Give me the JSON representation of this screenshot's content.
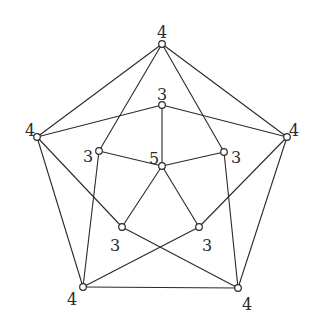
{
  "diagram": {
    "type": "graph",
    "nodes": [
      {
        "id": "A",
        "x": 162,
        "y": 44,
        "label": "4",
        "lx": 162,
        "ly": 33,
        "anchor": "middle"
      },
      {
        "id": "B",
        "x": 37,
        "y": 137,
        "label": "4",
        "lx": 30,
        "ly": 131,
        "anchor": "middle"
      },
      {
        "id": "C",
        "x": 287,
        "y": 137,
        "label": "4",
        "lx": 294,
        "ly": 131,
        "anchor": "middle"
      },
      {
        "id": "D",
        "x": 83,
        "y": 287,
        "label": "4",
        "lx": 72,
        "ly": 300,
        "anchor": "middle"
      },
      {
        "id": "E",
        "x": 238,
        "y": 288,
        "label": "4",
        "lx": 247,
        "ly": 305,
        "anchor": "middle"
      },
      {
        "id": "F",
        "x": 162,
        "y": 105,
        "label": "3",
        "lx": 162,
        "ly": 95,
        "anchor": "middle"
      },
      {
        "id": "G",
        "x": 99,
        "y": 151,
        "label": "3",
        "lx": 88,
        "ly": 157,
        "anchor": "middle"
      },
      {
        "id": "H",
        "x": 224,
        "y": 152,
        "label": "3",
        "lx": 236,
        "ly": 158,
        "anchor": "middle"
      },
      {
        "id": "K",
        "x": 162,
        "y": 166,
        "label": "5",
        "lx": 154,
        "ly": 159,
        "anchor": "middle"
      },
      {
        "id": "I",
        "x": 122,
        "y": 227,
        "label": "3",
        "lx": 115,
        "ly": 246,
        "anchor": "middle"
      },
      {
        "id": "J",
        "x": 199,
        "y": 227,
        "label": "3",
        "lx": 207,
        "ly": 246,
        "anchor": "middle"
      }
    ],
    "edges": [
      [
        "A",
        "B"
      ],
      [
        "A",
        "C"
      ],
      [
        "B",
        "D"
      ],
      [
        "C",
        "E"
      ],
      [
        "D",
        "E"
      ],
      [
        "A",
        "G"
      ],
      [
        "A",
        "H"
      ],
      [
        "B",
        "F"
      ],
      [
        "C",
        "F"
      ],
      [
        "B",
        "I"
      ],
      [
        "C",
        "J"
      ],
      [
        "G",
        "D"
      ],
      [
        "H",
        "E"
      ],
      [
        "I",
        "E"
      ],
      [
        "J",
        "D"
      ],
      [
        "F",
        "K"
      ],
      [
        "G",
        "K"
      ],
      [
        "H",
        "K"
      ],
      [
        "I",
        "K"
      ],
      [
        "J",
        "K"
      ]
    ]
  }
}
